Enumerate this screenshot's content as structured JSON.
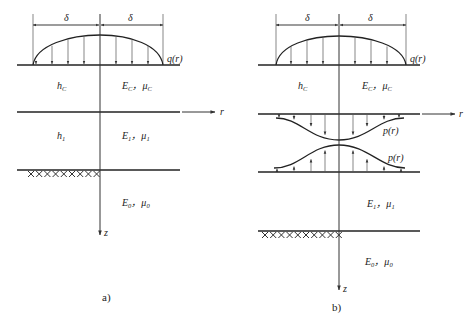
{
  "panel_a": {
    "caption": "a)",
    "delta_left": "δ",
    "delta_right": "δ",
    "load_label": "q(r)",
    "layer_c_thickness": "h",
    "layer_c_thickness_sub": "C",
    "layer_c_E": "E",
    "layer_c_E_sub": "C",
    "layer_c_mu": "μ",
    "layer_c_mu_sub": "C",
    "layer_1_thickness": "h",
    "layer_1_thickness_sub": "1",
    "layer_1_E": "E",
    "layer_1_E_sub": "1",
    "layer_1_mu": "μ",
    "layer_1_mu_sub": "1",
    "layer_0_E": "E",
    "layer_0_E_sub": "0",
    "layer_0_mu": "μ",
    "layer_0_mu_sub": "0",
    "axis_r": "r",
    "axis_z": "z",
    "separator": "，"
  },
  "panel_b": {
    "caption": "b)",
    "delta_left": "δ",
    "delta_right": "δ",
    "load_label": "q(r)",
    "contact_upper_label": "p(r)",
    "contact_lower_label": "p(r)",
    "layer_c_thickness": "h",
    "layer_c_thickness_sub": "C",
    "layer_c_E": "E",
    "layer_c_E_sub": "C",
    "layer_c_mu": "μ",
    "layer_c_mu_sub": "C",
    "layer_1_E": "E",
    "layer_1_E_sub": "1",
    "layer_1_mu": "μ",
    "layer_1_mu_sub": "1",
    "layer_0_E": "E",
    "layer_0_E_sub": "0",
    "layer_0_mu": "μ",
    "layer_0_mu_sub": "0",
    "axis_r": "r",
    "axis_z": "z",
    "separator": "，"
  }
}
